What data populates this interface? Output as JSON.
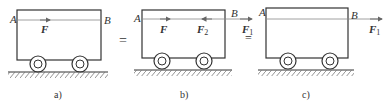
{
  "figure": {
    "panels": [
      {
        "id": "a",
        "caption": "a)",
        "point_labels": {
          "A": "A",
          "B": "B"
        },
        "forces": [
          {
            "label": "F",
            "subscript": "",
            "direction": "right",
            "at": "line-AB-center"
          }
        ]
      },
      {
        "id": "b",
        "caption": "b)",
        "point_labels": {
          "A": "A",
          "B": "B"
        },
        "forces": [
          {
            "label": "F",
            "subscript": "",
            "direction": "right"
          },
          {
            "label": "F",
            "subscript": "2",
            "direction": "left"
          },
          {
            "label": "F",
            "subscript": "1",
            "direction": "right",
            "at": "B"
          }
        ],
        "equal_mark": "="
      },
      {
        "id": "c",
        "caption": "c)",
        "point_labels": {
          "A": "A",
          "B": "B"
        },
        "forces": [
          {
            "label": "F",
            "subscript": "1",
            "direction": "right",
            "at": "B"
          }
        ]
      }
    ],
    "equals_sign": "=",
    "colors": {
      "stroke": "#333333",
      "line": "#888888",
      "background": "#ffffff"
    }
  }
}
